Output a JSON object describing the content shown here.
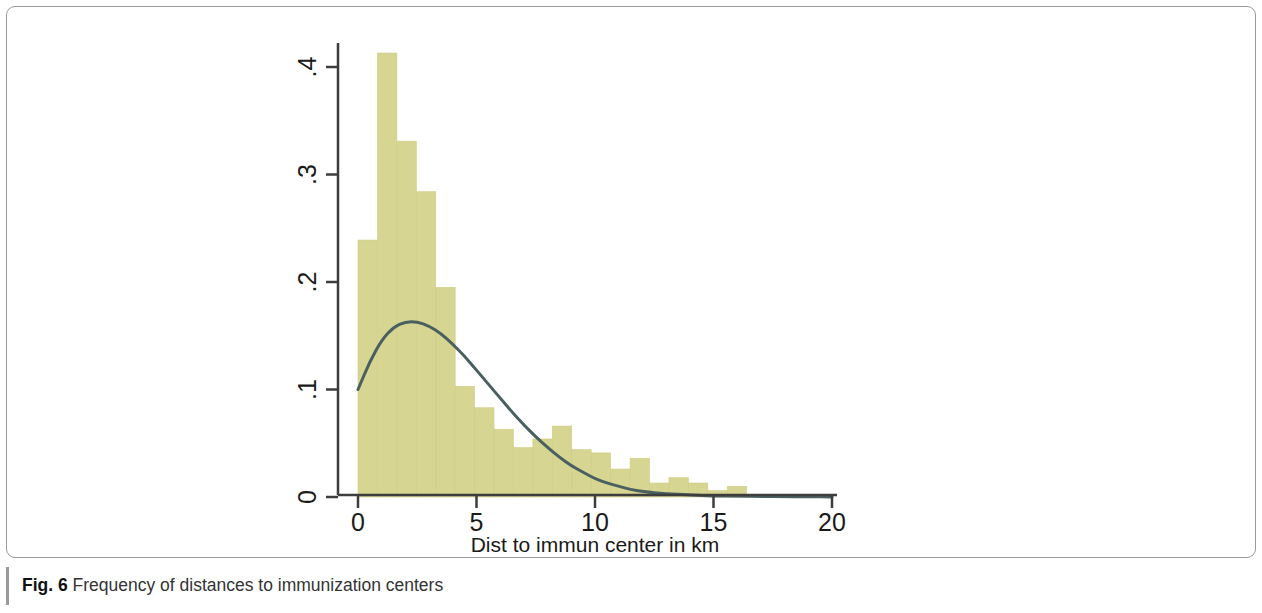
{
  "figure": {
    "caption_label": "Fig. 6",
    "caption_body": "Frequency of distances to immunization centers"
  },
  "colors": {
    "bar_fill": "#d6d592",
    "bar_edge": "#cfcd85",
    "curve": "#4a5f5f",
    "axis": "#3d3d3d",
    "frame": "#9a9a9a",
    "text": "#1a1a1a",
    "page_background": "#ffffff"
  },
  "chart_data": {
    "type": "bar",
    "subtype": "histogram-with-density-overlay",
    "title": "",
    "subtitle": "",
    "xlabel": "Dist to immun center in km",
    "ylabel": "",
    "xlim": [
      -0.2,
      20.6
    ],
    "ylim": [
      0,
      0.435
    ],
    "xticks": [
      0,
      5,
      10,
      15,
      20
    ],
    "xticklabels": [
      "0",
      "5",
      "10",
      "15",
      "20"
    ],
    "yticks": [
      0,
      0.1,
      0.2,
      0.3,
      0.4
    ],
    "yticklabels": [
      "0",
      ".1",
      ".2",
      ".3",
      ".4"
    ],
    "ytick_label_rotation": 90,
    "grid": false,
    "legend": false,
    "legend_position": "none",
    "bar_width": 0.82,
    "bin_width": 0.82,
    "categories": [
      0.41,
      1.23,
      2.05,
      2.87,
      3.69,
      4.51,
      5.33,
      6.15,
      6.97,
      7.79,
      8.61,
      9.43,
      10.25,
      11.07,
      11.89,
      12.71,
      13.53,
      14.35,
      15.17,
      15.99,
      16.81,
      17.63,
      18.45,
      19.27,
      20.09
    ],
    "values": [
      0.239,
      0.413,
      0.331,
      0.284,
      0.195,
      0.103,
      0.083,
      0.063,
      0.046,
      0.054,
      0.066,
      0.044,
      0.041,
      0.026,
      0.036,
      0.013,
      0.018,
      0.013,
      0.006,
      0.01,
      0.0,
      0.0,
      0.0,
      0.0,
      0.0
    ],
    "series": [
      {
        "name": "Frequency (density)",
        "type": "bar",
        "values": [
          0.239,
          0.413,
          0.331,
          0.284,
          0.195,
          0.103,
          0.083,
          0.063,
          0.046,
          0.054,
          0.066,
          0.044,
          0.041,
          0.026,
          0.036,
          0.013,
          0.018,
          0.013,
          0.006,
          0.01,
          0.0,
          0.0,
          0.0,
          0.0,
          0.0
        ]
      },
      {
        "name": "Fitted density curve",
        "type": "line",
        "x": [
          0.0,
          0.5,
          1.0,
          1.5,
          2.0,
          2.5,
          3.0,
          3.5,
          4.0,
          4.5,
          5.0,
          5.5,
          6.0,
          6.5,
          7.0,
          7.5,
          8.0,
          8.5,
          9.0,
          9.5,
          10.0,
          10.5,
          11.0,
          11.5,
          12.0,
          13.0,
          14.0,
          15.0,
          16.0,
          17.0,
          18.0,
          19.0,
          20.0
        ],
        "values": [
          0.1,
          0.126,
          0.146,
          0.158,
          0.163,
          0.163,
          0.159,
          0.152,
          0.142,
          0.131,
          0.118,
          0.105,
          0.092,
          0.079,
          0.067,
          0.056,
          0.046,
          0.037,
          0.029,
          0.023,
          0.017,
          0.013,
          0.01,
          0.007,
          0.005,
          0.003,
          0.002,
          0.001,
          0.0008,
          0.0005,
          0.0003,
          0.0002,
          0.0001
        ]
      }
    ]
  }
}
